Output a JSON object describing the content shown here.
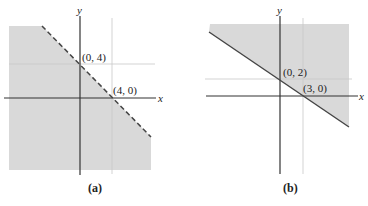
{
  "figures": [
    {
      "caption": "(a)",
      "axis_x_label": "x",
      "axis_y_label": "y",
      "points": [
        {
          "label": "(0, 4)",
          "x": 0,
          "y": 4
        },
        {
          "label": "(4, 0)",
          "x": 4,
          "y": 0
        }
      ],
      "boundary": "dashed",
      "shaded_region": "below-left of line x + y = 4"
    },
    {
      "caption": "(b)",
      "axis_x_label": "x",
      "axis_y_label": "y",
      "points": [
        {
          "label": "(0, 2)",
          "x": 0,
          "y": 2
        },
        {
          "label": "(3, 0)",
          "x": 3,
          "y": 0
        }
      ],
      "boundary": "solid",
      "shaded_region": "above-right of line 2x + 3y = 6"
    }
  ],
  "colors": {
    "shade": "#d9d9d9",
    "axis": "#333333",
    "grid": "#c8c8c8",
    "boundary": "#444444"
  }
}
